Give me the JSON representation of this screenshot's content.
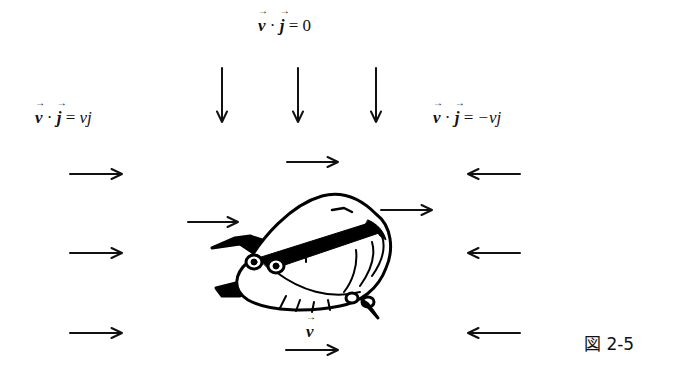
{
  "labels": {
    "top": {
      "lhs_v": "v",
      "dot": "·",
      "lhs_j": "j",
      "eq": "=",
      "rhs": "0"
    },
    "left": {
      "lhs_v": "v",
      "dot": "·",
      "lhs_j": "j",
      "eq": "=",
      "rhs": "vj"
    },
    "right": {
      "lhs_v": "v",
      "dot": "·",
      "lhs_j": "j",
      "eq": "=",
      "rhs": "−vj"
    },
    "velocity": "v"
  },
  "figure_caption": "図 2-5",
  "arrows": {
    "down": [
      {
        "x": 222,
        "y1": 68,
        "y2": 122
      },
      {
        "x": 298,
        "y1": 68,
        "y2": 122
      },
      {
        "x": 376,
        "y1": 68,
        "y2": 122
      }
    ],
    "left_column_right": [
      {
        "x1": 70,
        "x2": 122,
        "y": 174
      },
      {
        "x1": 70,
        "x2": 122,
        "y": 253
      },
      {
        "x1": 70,
        "x2": 122,
        "y": 333
      }
    ],
    "right_column_left": [
      {
        "x1": 468,
        "x2": 520,
        "y": 174
      },
      {
        "x1": 468,
        "x2": 520,
        "y": 253
      },
      {
        "x1": 468,
        "x2": 520,
        "y": 333
      }
    ],
    "center_right": [
      {
        "x1": 287,
        "x2": 338,
        "y": 162
      },
      {
        "x1": 188,
        "x2": 238,
        "y": 222
      },
      {
        "x1": 381,
        "x2": 432,
        "y": 210
      },
      {
        "x1": 286,
        "x2": 338,
        "y": 350
      }
    ]
  }
}
